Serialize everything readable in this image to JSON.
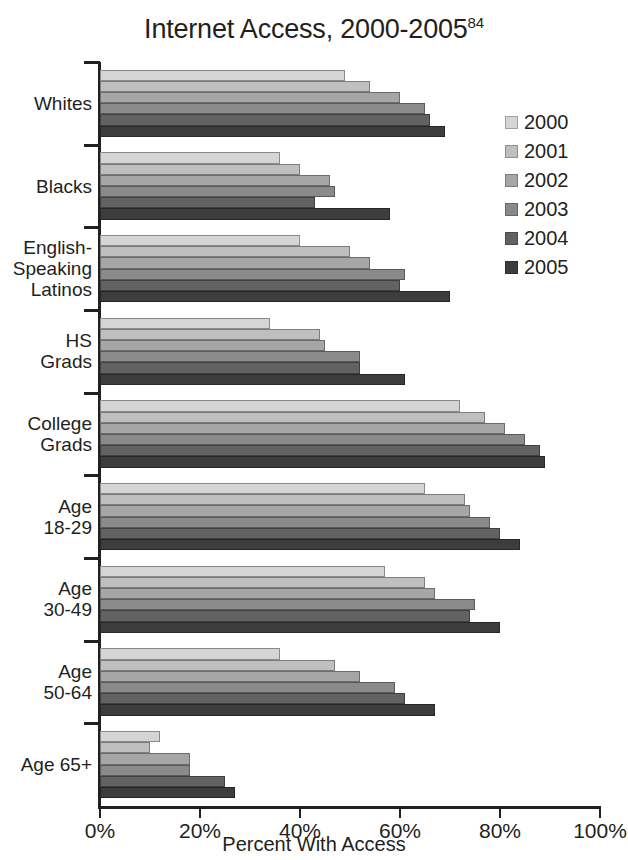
{
  "chart_data": {
    "type": "bar",
    "orientation": "horizontal",
    "title": "Internet Access, 2000-2005",
    "title_superscript": "84",
    "xlabel": "Percent With Access",
    "ylabel": "",
    "xlim": [
      0,
      100
    ],
    "xticks": [
      0,
      20,
      40,
      60,
      80,
      100
    ],
    "xtick_labels": [
      "0%",
      "20%",
      "40%",
      "60%",
      "80%",
      "100%"
    ],
    "grid": false,
    "legend_position": "right",
    "categories": [
      "Whites",
      "Blacks",
      "English-Speaking Latinos",
      "HS Grads",
      "College Grads",
      "Age 18-29",
      "Age 30-49",
      "Age 50-64",
      "Age 65+"
    ],
    "category_label_lines": [
      [
        "Whites"
      ],
      [
        "Blacks"
      ],
      [
        "English-",
        "Speaking",
        "Latinos"
      ],
      [
        "HS",
        "Grads"
      ],
      [
        "College",
        "Grads"
      ],
      [
        "Age",
        "18-29"
      ],
      [
        "Age",
        "30-49"
      ],
      [
        "Age",
        "50-64"
      ],
      [
        "Age 65+"
      ]
    ],
    "series": [
      {
        "name": "2000",
        "color": "#d5d5d5",
        "values": [
          49,
          36,
          40,
          34,
          72,
          65,
          57,
          36,
          12
        ]
      },
      {
        "name": "2001",
        "color": "#bfbfbf",
        "values": [
          54,
          40,
          50,
          44,
          77,
          73,
          65,
          47,
          10
        ]
      },
      {
        "name": "2002",
        "color": "#a6a6a6",
        "values": [
          60,
          46,
          54,
          45,
          81,
          74,
          67,
          52,
          18
        ]
      },
      {
        "name": "2003",
        "color": "#8a8a8a",
        "values": [
          65,
          47,
          61,
          52,
          85,
          78,
          75,
          59,
          18
        ]
      },
      {
        "name": "2004",
        "color": "#626262",
        "values": [
          66,
          43,
          60,
          52,
          88,
          80,
          74,
          61,
          25
        ]
      },
      {
        "name": "2005",
        "color": "#3d3d3d",
        "values": [
          69,
          58,
          70,
          61,
          89,
          84,
          80,
          67,
          27
        ]
      }
    ]
  },
  "legend": {
    "items": [
      {
        "label": "2000"
      },
      {
        "label": "2001"
      },
      {
        "label": "2002"
      },
      {
        "label": "2003"
      },
      {
        "label": "2004"
      },
      {
        "label": "2005"
      }
    ]
  }
}
